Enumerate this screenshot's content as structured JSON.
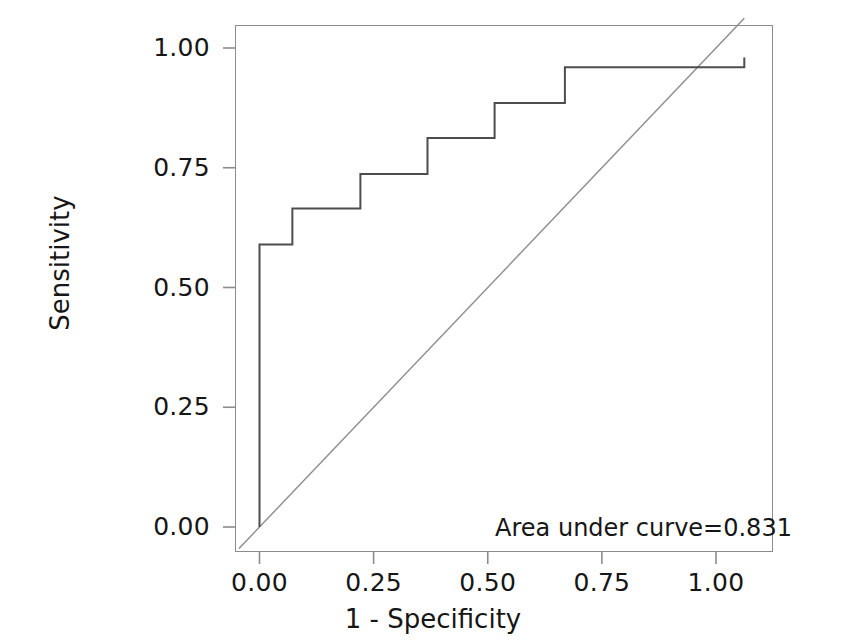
{
  "chart_data": {
    "type": "line",
    "title": "",
    "subtitle": "",
    "xlabel": "1 - Specificity",
    "ylabel": "Sensitivity",
    "xlim": [
      -0.05,
      1.08
    ],
    "ylim": [
      -0.06,
      1.06
    ],
    "xticks": [
      "0.00",
      "0.25",
      "0.50",
      "0.75",
      "1.00"
    ],
    "xtick_values": [
      0.0,
      0.25,
      0.5,
      0.75,
      1.0
    ],
    "yticks": [
      "0.00",
      "0.25",
      "0.50",
      "0.75",
      "1.00"
    ],
    "ytick_values": [
      0.0,
      0.25,
      0.5,
      0.75,
      1.0
    ],
    "grid": false,
    "legend": null,
    "annotations": [
      {
        "name": "auc-label",
        "text": "Area under curve=0.831",
        "x": 0.99,
        "y": 0.02
      }
    ],
    "series": [
      {
        "name": "ROC curve",
        "type": "step",
        "color": "#4d4d4d",
        "width": 2,
        "x": [
          0.0,
          0.0,
          0.072,
          0.072,
          0.221,
          0.221,
          0.368,
          0.368,
          0.515,
          0.515,
          0.669,
          0.669,
          1.062,
          1.062
        ],
        "y": [
          0.0,
          0.59,
          0.59,
          0.665,
          0.665,
          0.737,
          0.737,
          0.812,
          0.812,
          0.885,
          0.885,
          0.96,
          0.96,
          0.98
        ]
      },
      {
        "name": "Reference diagonal",
        "type": "line",
        "color": "#8c8c8c",
        "width": 1,
        "x": [
          -0.045,
          1.062
        ],
        "y": [
          -0.045,
          1.062
        ]
      }
    ]
  },
  "axes": {
    "x": {
      "label": "1 - Specificity",
      "ticks": [
        "0.00",
        "0.25",
        "0.50",
        "0.75",
        "1.00"
      ]
    },
    "y": {
      "label": "Sensitivity",
      "ticks": [
        "0.00",
        "0.25",
        "0.50",
        "0.75",
        "1.00"
      ]
    }
  },
  "annotation": {
    "auc_text": "Area under curve=0.831",
    "auc_value": 0.831
  },
  "colors": {
    "curve": "#4d4d4d",
    "diagonal": "#8c8c8c",
    "frame": "#8c8c8c",
    "text": "#161616",
    "background": "#ffffff"
  }
}
